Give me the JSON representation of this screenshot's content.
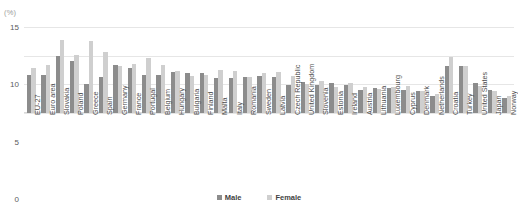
{
  "header": {
    "cropped_title_fragment": "",
    "unit_label": "(%)"
  },
  "legend": {
    "position": "bottom-center",
    "items": [
      {
        "label": "Male",
        "color": "#8c8c8c"
      },
      {
        "label": "Female",
        "color": "#cfcfcf"
      }
    ]
  },
  "colors": {
    "male": "#8c8c8c",
    "female": "#cfcfcf",
    "gridline": "#e6e6e6",
    "text": "#4d4d4d",
    "background": "#ffffff"
  },
  "chart_data": {
    "type": "bar",
    "title": "",
    "subtitle": "",
    "xlabel": "",
    "ylabel": "(%)",
    "ylim": [
      0,
      15
    ],
    "yticks": [
      0,
      5,
      10,
      15
    ],
    "grid": true,
    "legend_position": "bottom-center",
    "categories": [
      "EU-27",
      "Euro area",
      "Slovakia",
      "Poland",
      "Greece",
      "Spain",
      "Germany",
      "France",
      "Portugal",
      "Belgium",
      "Hungary",
      "Bulgaria",
      "Finland",
      "Malta",
      "Italy",
      "Romania",
      "Sweden",
      "Latvia",
      "Czech Republic",
      "United Kingdom",
      "Slovenia",
      "Estonia",
      "Ireland",
      "Austria",
      "Lithuania",
      "Luxembourg",
      "Cyprus",
      "Denmark",
      "Netherlands",
      "Croatia",
      "Turkey",
      "United States",
      "Japan",
      "Norway"
    ],
    "series": [
      {
        "name": "Male",
        "color": "#8c8c8c",
        "values": [
          6.6,
          6.7,
          9.9,
          9.0,
          5.0,
          6.2,
          8.3,
          7.9,
          6.7,
          6.7,
          7.1,
          7.0,
          7.0,
          6.1,
          6.1,
          6.2,
          6.5,
          6.3,
          4.8,
          5.4,
          4.8,
          5.2,
          4.8,
          4.0,
          4.3,
          4.3,
          4.0,
          3.8,
          3.0,
          8.2,
          8.2,
          5.3,
          4.1,
          2.6
        ]
      },
      {
        "name": "Female",
        "color": "#cfcfcf",
        "values": [
          7.8,
          8.4,
          12.7,
          10.2,
          12.6,
          10.6,
          8.2,
          8.6,
          9.6,
          8.4,
          7.4,
          6.4,
          6.6,
          7.5,
          7.3,
          6.2,
          6.9,
          7.2,
          6.4,
          5.0,
          5.6,
          4.6,
          5.2,
          4.6,
          4.2,
          4.5,
          4.7,
          3.9,
          3.4,
          9.7,
          8.2,
          4.7,
          3.9,
          2.9
        ]
      }
    ]
  }
}
